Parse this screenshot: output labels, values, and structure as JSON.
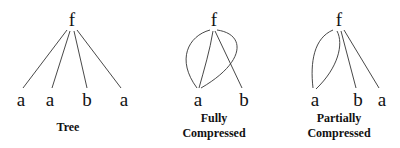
{
  "diagrams": [
    {
      "id": "tree",
      "root": {
        "label": "f"
      },
      "leaves": [
        {
          "label": "a"
        },
        {
          "label": "a"
        },
        {
          "label": "b"
        },
        {
          "label": "a"
        }
      ],
      "caption": [
        "Tree"
      ]
    },
    {
      "id": "fully_compressed",
      "root": {
        "label": "f"
      },
      "leaves": [
        {
          "label": "a"
        },
        {
          "label": "b"
        }
      ],
      "caption": [
        "Fully",
        "Compressed"
      ]
    },
    {
      "id": "partially_compressed",
      "root": {
        "label": "f"
      },
      "leaves": [
        {
          "label": "a"
        },
        {
          "label": "b"
        },
        {
          "label": "a"
        }
      ],
      "caption": [
        "Partially",
        "Compressed"
      ]
    }
  ],
  "colors": {
    "ink": "#111111",
    "edge": "#333333",
    "background": "#ffffff"
  }
}
